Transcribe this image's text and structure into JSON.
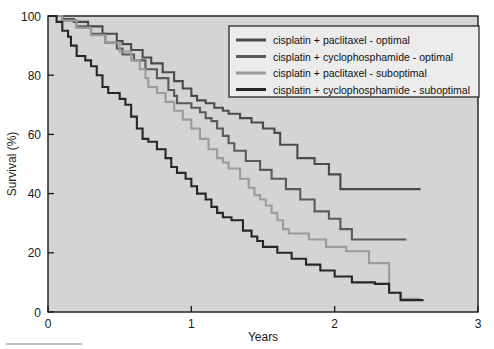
{
  "chart_data": {
    "type": "line",
    "title": "",
    "subtitle": "",
    "xlabel": "Years",
    "ylabel": "Survival (%)",
    "xlim": [
      0,
      3
    ],
    "ylim": [
      0,
      100
    ],
    "xticks": [
      0,
      1,
      2,
      3
    ],
    "xtick_labels": [
      "0",
      "1",
      "2",
      "3"
    ],
    "yticks": [
      0,
      20,
      40,
      60,
      80,
      100
    ],
    "ytick_labels": [
      "0",
      "20",
      "40",
      "60",
      "80",
      "100"
    ],
    "grid": false,
    "plot_background": "#d4d4d4",
    "figure_background": "#ffffff",
    "legend_position": "top-right",
    "curve_style": "step (Kaplan-Meier survival)",
    "series": [
      {
        "name": "cisplatin + paclitaxel - optimal",
        "color": "#4a4a4a",
        "final_value": 41.5,
        "points": [
          [
            0.0,
            100
          ],
          [
            0.1,
            99
          ],
          [
            0.18,
            98
          ],
          [
            0.28,
            96.5
          ],
          [
            0.38,
            94
          ],
          [
            0.48,
            91.5
          ],
          [
            0.52,
            90.5
          ],
          [
            0.58,
            88.5
          ],
          [
            0.66,
            86
          ],
          [
            0.72,
            84
          ],
          [
            0.8,
            81
          ],
          [
            0.88,
            78
          ],
          [
            0.94,
            75.5
          ],
          [
            1.0,
            73
          ],
          [
            1.04,
            71.5
          ],
          [
            1.1,
            70.5
          ],
          [
            1.16,
            69
          ],
          [
            1.22,
            68
          ],
          [
            1.26,
            67
          ],
          [
            1.34,
            65.5
          ],
          [
            1.42,
            64
          ],
          [
            1.5,
            62
          ],
          [
            1.58,
            60.5
          ],
          [
            1.6,
            60.5
          ],
          [
            1.62,
            56.5
          ],
          [
            1.72,
            56.5
          ],
          [
            1.74,
            52
          ],
          [
            1.82,
            52
          ],
          [
            1.86,
            50
          ],
          [
            1.92,
            50
          ],
          [
            1.96,
            46.5
          ],
          [
            2.02,
            46.5
          ],
          [
            2.04,
            41.5
          ],
          [
            2.6,
            41.5
          ]
        ]
      },
      {
        "name": "cisplatin + cyclophosphamide - optimal",
        "color": "#5a5a5a",
        "final_value": 24.5,
        "points": [
          [
            0.0,
            100
          ],
          [
            0.1,
            98.5
          ],
          [
            0.2,
            96.5
          ],
          [
            0.3,
            94
          ],
          [
            0.4,
            91
          ],
          [
            0.48,
            89
          ],
          [
            0.5,
            89
          ],
          [
            0.52,
            87
          ],
          [
            0.6,
            85
          ],
          [
            0.68,
            82
          ],
          [
            0.76,
            79
          ],
          [
            0.84,
            75
          ],
          [
            0.88,
            73
          ],
          [
            0.9,
            70.5
          ],
          [
            0.98,
            70.5
          ],
          [
            1.0,
            69
          ],
          [
            1.06,
            67.5
          ],
          [
            1.1,
            65.5
          ],
          [
            1.14,
            64.5
          ],
          [
            1.18,
            62
          ],
          [
            1.22,
            59.5
          ],
          [
            1.26,
            57
          ],
          [
            1.3,
            54.5
          ],
          [
            1.34,
            54.5
          ],
          [
            1.38,
            51
          ],
          [
            1.44,
            51
          ],
          [
            1.48,
            48
          ],
          [
            1.54,
            48
          ],
          [
            1.56,
            45
          ],
          [
            1.62,
            45
          ],
          [
            1.66,
            41.5
          ],
          [
            1.72,
            41.5
          ],
          [
            1.76,
            38
          ],
          [
            1.82,
            38
          ],
          [
            1.86,
            34
          ],
          [
            1.92,
            34
          ],
          [
            1.96,
            31.5
          ],
          [
            2.02,
            31.5
          ],
          [
            2.04,
            28
          ],
          [
            2.1,
            28
          ],
          [
            2.12,
            24.5
          ],
          [
            2.5,
            24.5
          ]
        ]
      },
      {
        "name": "cisplatin + paclitaxel - suboptimal",
        "color": "#9b9b9b",
        "final_value": 4.5,
        "points": [
          [
            0.0,
            100
          ],
          [
            0.1,
            98.5
          ],
          [
            0.2,
            96
          ],
          [
            0.3,
            93.5
          ],
          [
            0.4,
            91
          ],
          [
            0.5,
            88
          ],
          [
            0.58,
            85
          ],
          [
            0.64,
            82
          ],
          [
            0.68,
            79
          ],
          [
            0.7,
            76
          ],
          [
            0.76,
            74
          ],
          [
            0.82,
            71
          ],
          [
            0.88,
            68
          ],
          [
            0.94,
            65
          ],
          [
            1.0,
            62
          ],
          [
            1.06,
            58.5
          ],
          [
            1.12,
            55
          ],
          [
            1.18,
            52
          ],
          [
            1.22,
            50.5
          ],
          [
            1.26,
            48.5
          ],
          [
            1.3,
            48.5
          ],
          [
            1.34,
            45
          ],
          [
            1.4,
            42
          ],
          [
            1.44,
            39.5
          ],
          [
            1.48,
            38
          ],
          [
            1.52,
            36
          ],
          [
            1.56,
            33.5
          ],
          [
            1.6,
            31
          ],
          [
            1.64,
            28
          ],
          [
            1.68,
            26.5
          ],
          [
            1.78,
            26.5
          ],
          [
            1.82,
            24.5
          ],
          [
            1.9,
            24.5
          ],
          [
            1.94,
            22
          ],
          [
            2.04,
            22
          ],
          [
            2.08,
            20.5
          ],
          [
            2.2,
            20.5
          ],
          [
            2.24,
            16.5
          ],
          [
            2.34,
            16.5
          ],
          [
            2.38,
            6.5
          ],
          [
            2.44,
            6.5
          ],
          [
            2.46,
            4.5
          ],
          [
            2.6,
            4.5
          ]
        ]
      },
      {
        "name": "cisplatin + cyclophosphamide - suboptimal",
        "color": "#262626",
        "final_value": 4.0,
        "points": [
          [
            0.0,
            100
          ],
          [
            0.06,
            98
          ],
          [
            0.1,
            95
          ],
          [
            0.14,
            93
          ],
          [
            0.16,
            90
          ],
          [
            0.2,
            86.5
          ],
          [
            0.26,
            85
          ],
          [
            0.3,
            83
          ],
          [
            0.34,
            80
          ],
          [
            0.38,
            76
          ],
          [
            0.42,
            74
          ],
          [
            0.5,
            72
          ],
          [
            0.54,
            70
          ],
          [
            0.58,
            66
          ],
          [
            0.62,
            62
          ],
          [
            0.66,
            58.5
          ],
          [
            0.7,
            57.5
          ],
          [
            0.76,
            55
          ],
          [
            0.82,
            52
          ],
          [
            0.86,
            49
          ],
          [
            0.9,
            47
          ],
          [
            0.96,
            45
          ],
          [
            1.0,
            42.5
          ],
          [
            1.04,
            40
          ],
          [
            1.1,
            38
          ],
          [
            1.14,
            35.5
          ],
          [
            1.18,
            33.5
          ],
          [
            1.22,
            32
          ],
          [
            1.28,
            31
          ],
          [
            1.32,
            31
          ],
          [
            1.36,
            27.5
          ],
          [
            1.42,
            25.5
          ],
          [
            1.46,
            24
          ],
          [
            1.5,
            22
          ],
          [
            1.56,
            22
          ],
          [
            1.6,
            20
          ],
          [
            1.66,
            20
          ],
          [
            1.7,
            18
          ],
          [
            1.76,
            18
          ],
          [
            1.8,
            16
          ],
          [
            1.86,
            16
          ],
          [
            1.9,
            14
          ],
          [
            1.96,
            14
          ],
          [
            2.0,
            12
          ],
          [
            2.08,
            12
          ],
          [
            2.12,
            10
          ],
          [
            2.24,
            10
          ],
          [
            2.28,
            9.5
          ],
          [
            2.34,
            9.5
          ],
          [
            2.38,
            6.5
          ],
          [
            2.44,
            6.5
          ],
          [
            2.46,
            4.0
          ],
          [
            2.62,
            4.0
          ]
        ]
      }
    ]
  },
  "legend": {
    "items": [
      {
        "label": "cisplatin + paclitaxel - optimal",
        "color": "#4a4a4a"
      },
      {
        "label": "cisplatin + cyclophosphamide - optimal",
        "color": "#5a5a5a"
      },
      {
        "label": "cisplatin + paclitaxel - suboptimal",
        "color": "#9b9b9b"
      },
      {
        "label": "cisplatin + cyclophosphamide - suboptimal",
        "color": "#262626"
      }
    ]
  }
}
